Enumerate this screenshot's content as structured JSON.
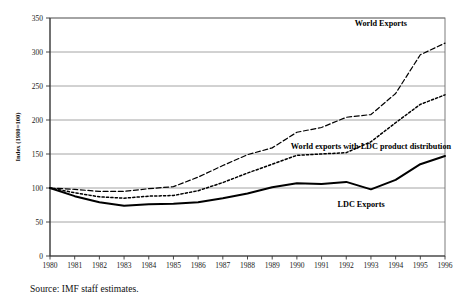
{
  "chart_data": {
    "type": "line",
    "title": "",
    "xlabel": "",
    "ylabel": "Index (1980=100)",
    "xlim": [
      1980,
      1996
    ],
    "ylim": [
      0,
      350
    ],
    "ytick_step": 50,
    "grid": true,
    "legend_position": "inline-annotations",
    "x": [
      1980,
      1981,
      1982,
      1983,
      1984,
      1985,
      1986,
      1987,
      1988,
      1989,
      1990,
      1991,
      1992,
      1993,
      1994,
      1995,
      1996
    ],
    "categories": [
      "1980",
      "1981",
      "1982",
      "1983",
      "1984",
      "1985",
      "1986",
      "1987",
      "1988",
      "1989",
      "1990",
      "1991",
      "1992",
      "1993",
      "1994",
      "1995",
      "1996"
    ],
    "yticks": [
      0,
      50,
      100,
      150,
      200,
      250,
      300,
      350
    ],
    "ytick_labels": [
      "0",
      "50",
      "100",
      "150",
      "200",
      "250",
      "300",
      "350"
    ],
    "series": [
      {
        "name": "World Exports",
        "style": "dashed",
        "label": "World Exports",
        "values": [
          100,
          98,
          95,
          95,
          99,
          102,
          116,
          133,
          149,
          159,
          182,
          189,
          204,
          208,
          239,
          296,
          313
        ]
      },
      {
        "name": "World exports with LDC product distribution",
        "style": "dotted",
        "label": "World exports with LDC product distribution",
        "values": [
          100,
          93,
          87,
          85,
          88,
          89,
          96,
          108,
          122,
          135,
          148,
          150,
          152,
          168,
          196,
          223,
          237
        ]
      },
      {
        "name": "LDC Exports",
        "style": "solid",
        "label": "LDC Exports",
        "values": [
          100,
          88,
          79,
          74,
          76,
          77,
          79,
          85,
          92,
          101,
          107,
          106,
          109,
          98,
          112,
          135,
          147
        ]
      }
    ],
    "annotations": [
      {
        "text": "World Exports",
        "x": 1993.4,
        "y": 338
      },
      {
        "text": "World exports with LDC product distribution",
        "x": 1993.0,
        "y": 158
      },
      {
        "text": "LDC Exports",
        "x": 1992.6,
        "y": 72
      }
    ]
  },
  "source": {
    "note": "Source: IMF staff estimates."
  }
}
